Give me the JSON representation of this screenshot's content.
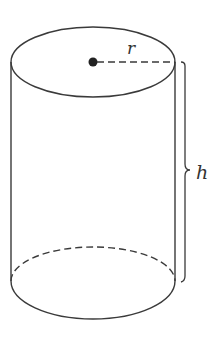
{
  "diagram": {
    "type": "cylinder",
    "labels": {
      "radius": "r",
      "height": "h"
    },
    "colors": {
      "stroke": "#3a3a3a",
      "background": "#ffffff"
    }
  }
}
